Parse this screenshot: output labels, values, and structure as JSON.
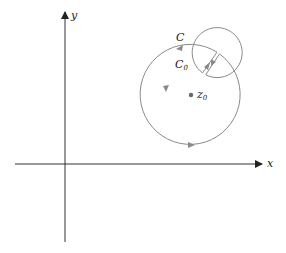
{
  "diagram": {
    "type": "complex-plane contour (keyhole) diagram",
    "axes": {
      "x_label": "x",
      "y_label": "y"
    },
    "curves": {
      "outer_label": "C",
      "inner_label": "C",
      "inner_label_sub": "0"
    },
    "point": {
      "label": "z",
      "label_sub": "0"
    },
    "colors": {
      "axis": "#333333",
      "contour": "#8a8a8a",
      "point": "#666666"
    }
  }
}
